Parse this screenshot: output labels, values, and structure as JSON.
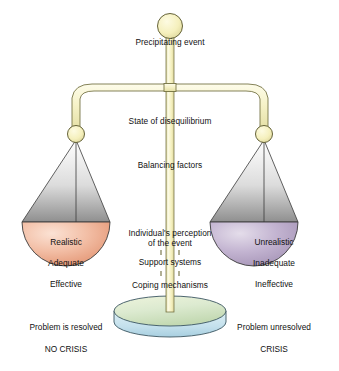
{
  "diagram": {
    "center_labels": [
      {
        "text": "Precipitating event",
        "x": 170,
        "y": 42
      },
      {
        "text": "State of disequilibrium",
        "x": 170,
        "y": 121
      },
      {
        "text": "Balancing factors",
        "x": 170,
        "y": 165
      },
      {
        "text": "Individual's perception",
        "x": 170,
        "y": 233
      },
      {
        "text": "of the event",
        "x": 170,
        "y": 243
      },
      {
        "text": "Support systems",
        "x": 170,
        "y": 262
      },
      {
        "text": "Coping mechanisms",
        "x": 170,
        "y": 285
      }
    ],
    "left_pan": {
      "name": "no-crisis-pan",
      "words": [
        "Realistic",
        "Adequate",
        "Effective"
      ],
      "word_x": 66,
      "word_ys": [
        242,
        263,
        284
      ],
      "fill_top": "#f5cbb5",
      "fill_bottom": "#e79170",
      "upper_fill_top": "#fdfdfd",
      "upper_fill_bottom": "#9d9d9d"
    },
    "right_pan": {
      "name": "crisis-pan",
      "words": [
        "Unrealistic",
        "Inadequate",
        "Ineffective"
      ],
      "word_x": 274,
      "word_ys": [
        242,
        263,
        284
      ],
      "fill_top": "#cdc1d8",
      "fill_bottom": "#a897b8",
      "upper_fill_top": "#fdfdfd",
      "upper_fill_bottom": "#9d9d9d"
    },
    "captions": [
      {
        "text": "Problem is resolved",
        "x": 66,
        "y": 327
      },
      {
        "text": "NO CRISIS",
        "x": 66,
        "y": 349
      },
      {
        "text": "Problem unresolved",
        "x": 274,
        "y": 327
      },
      {
        "text": "CRISIS",
        "x": 274,
        "y": 349
      }
    ],
    "colors": {
      "beam_fill_light": "#fbfadf",
      "beam_fill_mid": "#eeeab4",
      "beam_stroke": "#6f6d3d",
      "post_fill_light": "#fdfce6",
      "post_fill_mid": "#f2edb6",
      "post_stroke": "#6f6d3d",
      "ball_fill": "#f7f3c4",
      "ball_stroke": "#5d5b30",
      "base_top_light": "#e9f0d2",
      "base_top_mid": "#c9dcb4",
      "base_side_light": "#d8ecf3",
      "base_side_mid": "#aed2e2",
      "base_stroke": "#3a5560",
      "string_stroke": "#3a3a3a",
      "pan_stroke": "#3a3a3a",
      "text": "#111111"
    }
  }
}
